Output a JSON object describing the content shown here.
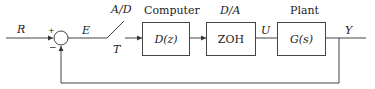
{
  "diagram": {
    "type": "block-diagram",
    "signals": {
      "reference": "R",
      "error": "E",
      "sample_period": "T",
      "control": "U",
      "output": "Y"
    },
    "summing_junction": {
      "plus_sign": "+",
      "minus_sign": "−"
    },
    "switch": {
      "label": "A/D"
    },
    "blocks": [
      {
        "title": "Computer",
        "content": "D(z)"
      },
      {
        "title": "D/A",
        "content": "ZOH"
      },
      {
        "title": "Plant",
        "content": "G(s)"
      }
    ],
    "colors": {
      "line": "#444444",
      "text": "#222222",
      "background": "#ffffff"
    }
  }
}
